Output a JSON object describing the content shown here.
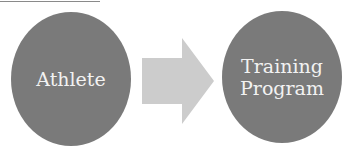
{
  "diagram": {
    "nodes": [
      {
        "id": "athlete",
        "label": "Athlete",
        "fill": "#7a7a7a",
        "text_color": "#f2f2f2"
      },
      {
        "id": "training-program",
        "label": "Training\nProgram",
        "fill": "#7a7a7a",
        "text_color": "#f2f2f2"
      }
    ],
    "edges": [
      {
        "from": "athlete",
        "to": "training-program",
        "shape": "block-arrow",
        "fill": "#cccccc"
      }
    ]
  }
}
